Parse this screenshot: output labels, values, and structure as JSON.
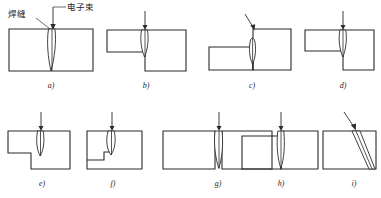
{
  "figure": {
    "title": "",
    "background_color": "#ffffff",
    "line_color": "#2b2b2b",
    "annotations": {
      "weld_seam_label": "焊缝",
      "electron_beam_label": "电子束"
    },
    "panels": [
      {
        "key": "a",
        "caption": "a)",
        "joint_type": "butt joint, equal thickness plates",
        "beam_direction": "vertical",
        "weld_penetration": "full"
      },
      {
        "key": "b",
        "caption": "b)",
        "joint_type": "corner / T joint, left plate thin upper, right plate thick lower",
        "beam_direction": "vertical",
        "weld_penetration": "full"
      },
      {
        "key": "c",
        "caption": "c)",
        "joint_type": "corner joint, left plate low and thin, right plate tall",
        "beam_direction": "inclined",
        "weld_penetration": "partial"
      },
      {
        "key": "d",
        "caption": "d)",
        "joint_type": "corner joint, left plate upper thin, right plate lower offset",
        "beam_direction": "vertical",
        "weld_penetration": "full"
      },
      {
        "key": "e",
        "caption": "e)",
        "joint_type": "stepped lap joint",
        "beam_direction": "vertical",
        "weld_penetration": "partial"
      },
      {
        "key": "f",
        "caption": "f)",
        "joint_type": "plate with internal notch / step",
        "beam_direction": "vertical",
        "weld_penetration": "partial"
      },
      {
        "key": "g",
        "caption": "g)",
        "joint_type": "butt joint with narrow top gap",
        "beam_direction": "vertical",
        "weld_penetration": "full"
      },
      {
        "key": "h",
        "caption": "h)",
        "joint_type": "butt joint, right plate raised",
        "beam_direction": "vertical",
        "weld_penetration": "full"
      },
      {
        "key": "i",
        "caption": "i)",
        "joint_type": "inclined weld through single plate",
        "beam_direction": "inclined",
        "weld_penetration": "full"
      }
    ]
  }
}
